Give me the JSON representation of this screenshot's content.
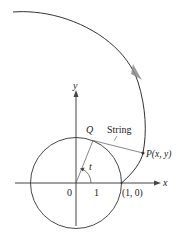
{
  "diagram": {
    "labels": {
      "y_axis": "y",
      "x_axis": "x",
      "origin": "0",
      "one": "1",
      "point_10": "(1, 0)",
      "Q": "Q",
      "string": "String",
      "P": "P(x, y)",
      "angle": "t"
    },
    "colors": {
      "line": "#333333",
      "arrow": "#8a8a8a",
      "text": "#222222"
    }
  }
}
